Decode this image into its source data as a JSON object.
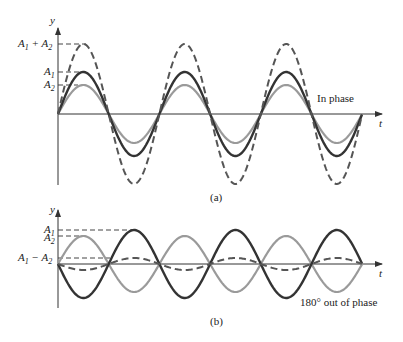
{
  "panel_a": {
    "caption": "(a)",
    "annotation": "In phase",
    "y_axis_label": "y",
    "x_axis_label": "t",
    "levels": {
      "sum": "A1 + A2",
      "a1": "A1",
      "a2": "A2"
    }
  },
  "panel_b": {
    "caption": "(b)",
    "annotation": "180° out of phase",
    "y_axis_label": "y",
    "x_axis_label": "t",
    "levels": {
      "a1": "A1",
      "a2": "A2",
      "diff": "A1 − A2"
    }
  },
  "colors": {
    "wave1": "#333333",
    "wave2": "#9a9a9a",
    "sum": "#555555",
    "axis": "#333333"
  }
}
